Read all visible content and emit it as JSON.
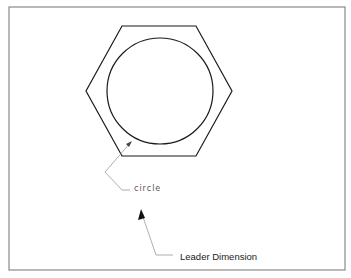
{
  "diagram": {
    "labels": {
      "circle": "circle",
      "leader": "Leader Dimension"
    },
    "colors": {
      "frame": "#8a8a8a",
      "shape": "#1a1a1a",
      "leader_line": "#9a9a9a",
      "arrow": "#111111"
    },
    "shapes": {
      "hexagon": {
        "points": [
          [
            122,
            26
          ],
          [
            196,
            26
          ],
          [
            232,
            91
          ],
          [
            196,
            156
          ],
          [
            122,
            156
          ],
          [
            86,
            91
          ]
        ]
      },
      "circle": {
        "cx": 160,
        "cy": 91,
        "r": 53
      }
    }
  }
}
